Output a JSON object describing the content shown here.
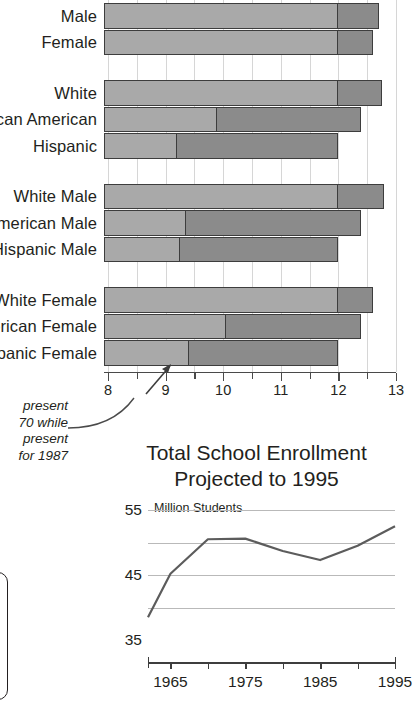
{
  "bar_chart": {
    "axis": {
      "ticks": [
        8,
        9,
        10,
        11,
        12,
        13
      ],
      "min": 7.93,
      "max": 13.0
    },
    "groups": [
      {
        "name": "by-sex",
        "rows": [
          {
            "label": "Male",
            "split": 12.0,
            "total": 12.7
          },
          {
            "label": "Female",
            "split": 12.0,
            "total": 12.6
          }
        ]
      },
      {
        "name": "by-race",
        "rows": [
          {
            "label": "White",
            "split": 12.0,
            "total": 12.75
          },
          {
            "label": "African American",
            "split": 9.9,
            "total": 12.4
          },
          {
            "label": "Hispanic",
            "split": 9.2,
            "total": 12.0
          }
        ]
      },
      {
        "name": "by-race-male",
        "rows": [
          {
            "label": "White Male",
            "split": 12.0,
            "total": 12.8
          },
          {
            "label": "African American Male",
            "split": 9.35,
            "total": 12.4
          },
          {
            "label": "Hispanic Male",
            "split": 9.25,
            "total": 12.0
          }
        ]
      },
      {
        "name": "by-race-female",
        "rows": [
          {
            "label": "White Female",
            "split": 12.0,
            "total": 12.6
          },
          {
            "label": "African American Female",
            "split": 10.05,
            "total": 12.4
          },
          {
            "label": "Hispanic Female",
            "split": 9.4,
            "total": 12.0
          }
        ]
      }
    ],
    "colors": {
      "light_segment": "#a9a9a9",
      "dark_segment": "#8b8b8b",
      "bar_outline": "#3d3d3d",
      "gridline": "#d6d6d6",
      "axis": "#4a4a4a"
    }
  },
  "annotation": {
    "lines": [
      "present",
      "70 while",
      "present",
      "for 1987"
    ]
  },
  "chart_data": {
    "type": "line",
    "title": "Total School Enrollment",
    "subtitle": "Projected to 1995",
    "ylabel": "Million Students",
    "xlabel": "",
    "x": [
      1962,
      1965,
      1970,
      1975,
      1980,
      1985,
      1990,
      1995
    ],
    "values": [
      38.5,
      45.2,
      50.5,
      50.6,
      48.7,
      47.3,
      49.5,
      52.5
    ],
    "ytick_labels": [
      "35",
      "45",
      "55"
    ],
    "ytick_values": [
      35,
      45,
      55
    ],
    "ylim": [
      35,
      55
    ],
    "gridlines": [
      40,
      45,
      50,
      55
    ],
    "xtick_labels": [
      "1965",
      "1975",
      "1985",
      "1995"
    ],
    "xtick_values": [
      1965,
      1975,
      1985,
      1995
    ],
    "xlim": [
      1962,
      1995
    ],
    "grid": true,
    "legend": "none",
    "line_color": "#5c5c5c"
  }
}
